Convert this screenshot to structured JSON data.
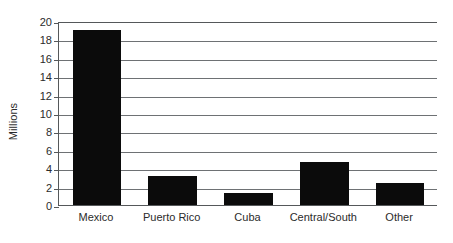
{
  "chart_data": {
    "type": "bar",
    "title": "",
    "xlabel": "",
    "ylabel": "Millions",
    "categories": [
      "Mexico",
      "Puerto Rico",
      "Cuba",
      "Central/South",
      "Other"
    ],
    "values": [
      19.0,
      3.1,
      1.3,
      4.7,
      2.4
    ],
    "ylim": [
      0,
      20
    ],
    "ytick_values": [
      0,
      2,
      4,
      6,
      8,
      10,
      12,
      14,
      16,
      18,
      20
    ],
    "ytick_labels": [
      "0",
      "2",
      "4",
      "6",
      "8",
      "10",
      "12",
      "14",
      "16",
      "18",
      "20"
    ],
    "grid": true,
    "legend": false,
    "bar_color": "#0b0b0b",
    "axis_color": "#55585a",
    "grid_color": "#6e7174",
    "background": "#ffffff"
  }
}
